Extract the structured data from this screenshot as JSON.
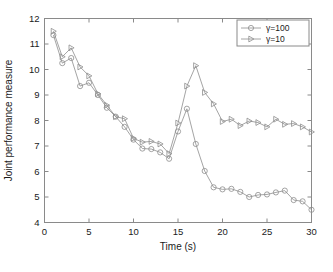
{
  "chart_data": {
    "type": "line",
    "title": "",
    "xlabel": "Time (s)",
    "ylabel": "Joint performance measure",
    "xlim": [
      0,
      30
    ],
    "ylim": [
      4,
      12
    ],
    "xticks": [
      0,
      5,
      10,
      15,
      20,
      25,
      30
    ],
    "yticks": [
      4,
      5,
      6,
      7,
      8,
      9,
      10,
      11,
      12
    ],
    "xticklabels": [
      "0",
      "5",
      "10",
      "15",
      "20",
      "25",
      "30"
    ],
    "yticklabels": [
      "4",
      "5",
      "6",
      "7",
      "8",
      "9",
      "10",
      "11",
      "12"
    ],
    "grid": false,
    "legend_position": "top-right",
    "x": [
      1,
      2,
      3,
      4,
      5,
      6,
      7,
      8,
      9,
      10,
      11,
      12,
      13,
      14,
      15,
      16,
      17,
      18,
      19,
      20,
      21,
      22,
      23,
      24,
      25,
      26,
      27,
      28,
      29,
      30
    ],
    "series": [
      {
        "name": "γ=100",
        "marker": "circle",
        "color": "#8d8d8d",
        "values": [
          11.35,
          10.25,
          10.45,
          9.35,
          9.48,
          9.0,
          8.5,
          8.15,
          7.75,
          7.25,
          6.9,
          6.88,
          6.75,
          6.5,
          7.57,
          8.46,
          7.08,
          6.02,
          5.38,
          5.3,
          5.32,
          5.2,
          5.0,
          5.08,
          5.1,
          5.18,
          5.25,
          4.88,
          4.83,
          4.5
        ]
      },
      {
        "name": "γ=10",
        "marker": "triangle-right",
        "color": "#8d8d8d",
        "values": [
          11.5,
          10.5,
          10.85,
          10.1,
          9.75,
          9.05,
          8.6,
          8.15,
          8.07,
          7.3,
          7.15,
          7.18,
          7.08,
          6.7,
          7.9,
          9.35,
          10.15,
          9.1,
          8.65,
          7.96,
          8.05,
          7.8,
          7.98,
          7.92,
          7.75,
          8.05,
          7.85,
          7.88,
          7.75,
          7.55
        ]
      }
    ]
  },
  "legend": {
    "items": [
      {
        "label": "γ=100"
      },
      {
        "label": "γ=10"
      }
    ]
  }
}
